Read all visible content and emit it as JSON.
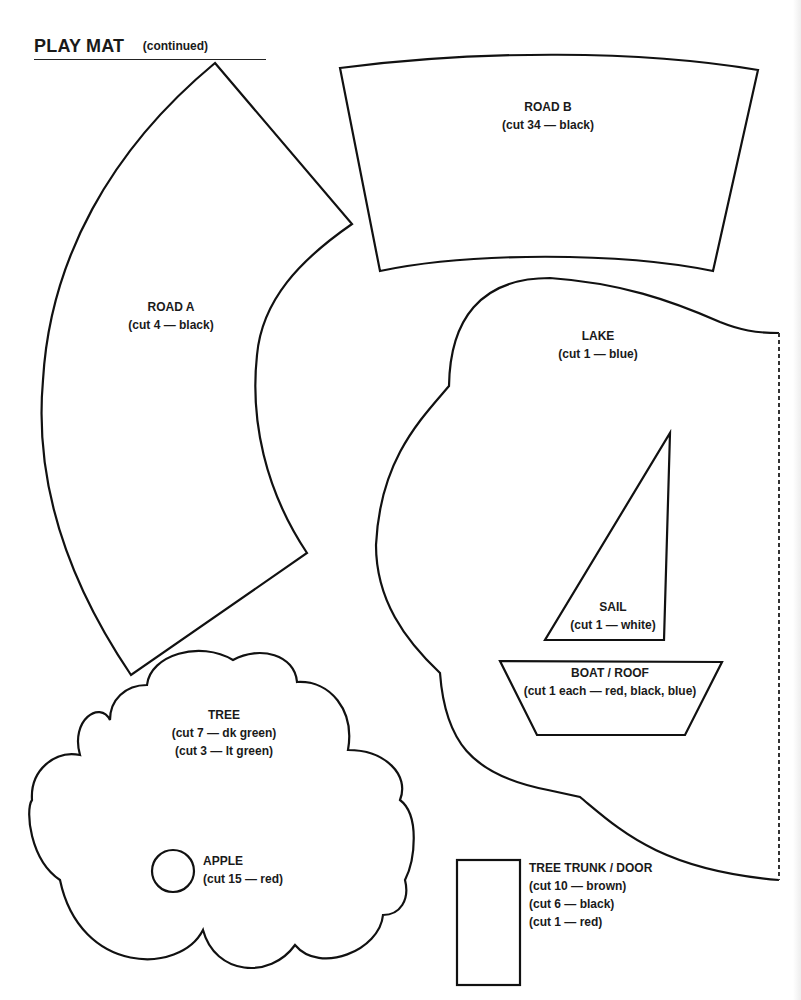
{
  "header": {
    "title": "PLAY MAT",
    "subtitle": "(continued)"
  },
  "pieces": {
    "road_a": {
      "name": "ROAD A",
      "cuts": [
        "(cut 4 — black)"
      ]
    },
    "road_b": {
      "name": "ROAD B",
      "cuts": [
        "(cut 34 — black)"
      ]
    },
    "lake": {
      "name": "LAKE",
      "cuts": [
        "(cut 1 — blue)"
      ]
    },
    "sail": {
      "name": "SAIL",
      "cuts": [
        "(cut 1 — white)"
      ]
    },
    "boat_roof": {
      "name": "BOAT / ROOF",
      "cuts": [
        "(cut 1 each — red, black, blue)"
      ]
    },
    "tree": {
      "name": "TREE",
      "cuts": [
        "(cut 7 — dk green)",
        "(cut 3 — lt green)"
      ]
    },
    "apple": {
      "name": "APPLE",
      "cuts": [
        "(cut 15 — red)"
      ]
    },
    "tree_trunk_door": {
      "name": "TREE TRUNK / DOOR",
      "cuts": [
        "(cut 10 — brown)",
        "(cut 6 — black)",
        "(cut 1 — red)"
      ]
    }
  },
  "colors": {
    "outline": "#111111",
    "fold_line": "#333333",
    "background": "#ffffff"
  }
}
